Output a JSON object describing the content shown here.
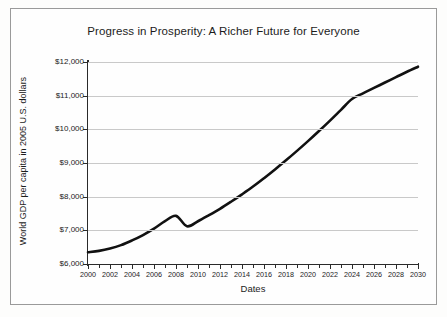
{
  "chart_data": {
    "type": "line",
    "title": "Progress in Prosperity: A Richer Future for Everyone",
    "xlabel": "Dates",
    "ylabel": "World GDP per capita in 2005 U.S. dollars",
    "grid": true,
    "legend": "none",
    "xlim": [
      2000,
      2030
    ],
    "ylim": [
      6000,
      12000
    ],
    "ytick_step": 1000,
    "xtick_step": 1,
    "xtick_label_step": 2,
    "ytick_labels": [
      "$12,000",
      "$11,000",
      "$10,000",
      "$9,000",
      "$8,000",
      "$7,000",
      "$6,000"
    ],
    "ytick_values": [
      12000,
      11000,
      10000,
      9000,
      8000,
      7000,
      6000
    ],
    "xtick_labels": [
      "2000",
      "2002",
      "2004",
      "2006",
      "2008",
      "2010",
      "2012",
      "2014",
      "2016",
      "2018",
      "2020",
      "2022",
      "2024",
      "2026",
      "2028",
      "2030"
    ],
    "xtick_values": [
      2000,
      2001,
      2002,
      2003,
      2004,
      2005,
      2006,
      2007,
      2008,
      2009,
      2010,
      2011,
      2012,
      2013,
      2014,
      2015,
      2016,
      2017,
      2018,
      2019,
      2020,
      2021,
      2022,
      2023,
      2024,
      2025,
      2026,
      2027,
      2028,
      2029,
      2030
    ],
    "series": [
      {
        "name": "World GDP per capita",
        "color": "#111111",
        "line_width": 2.6,
        "x": [
          2000,
          2001,
          2002,
          2003,
          2004,
          2005,
          2006,
          2007,
          2008,
          2009,
          2010,
          2011,
          2012,
          2013,
          2014,
          2015,
          2016,
          2017,
          2018,
          2019,
          2020,
          2021,
          2022,
          2023,
          2024,
          2025,
          2026,
          2027,
          2028,
          2029,
          2030
        ],
        "values": [
          6350,
          6390,
          6460,
          6560,
          6700,
          6860,
          7050,
          7270,
          7430,
          7120,
          7270,
          7450,
          7640,
          7850,
          8070,
          8300,
          8550,
          8810,
          9080,
          9360,
          9650,
          9950,
          10260,
          10580,
          10900,
          11070,
          11230,
          11390,
          11550,
          11710,
          11860
        ]
      }
    ],
    "annotations": [
      {
        "label": "2008-2009 global financial crisis dip",
        "x": 2009,
        "y": 7120
      }
    ]
  }
}
